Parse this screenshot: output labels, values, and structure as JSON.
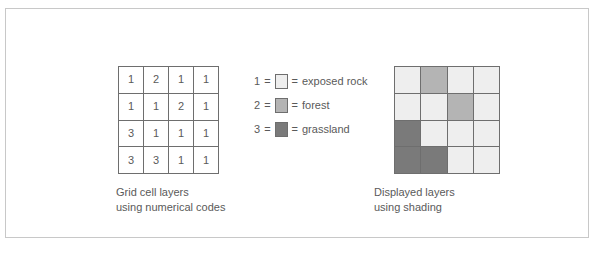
{
  "figure": {
    "border_color": "#c8c8c8",
    "background": "#ffffff"
  },
  "palette": {
    "exposed_rock": "#eeeeee",
    "forest": "#b4b4b4",
    "grassland": "#7a7a7a",
    "grid_line": "#6e6e6e",
    "text": "#5a5a5a"
  },
  "numeric_grid": {
    "caption_line1": "Grid cell layers",
    "caption_line2": "using numerical codes",
    "rows": [
      [
        "1",
        "2",
        "1",
        "1"
      ],
      [
        "1",
        "1",
        "2",
        "1"
      ],
      [
        "3",
        "1",
        "1",
        "1"
      ],
      [
        "3",
        "3",
        "1",
        "1"
      ]
    ]
  },
  "legend": {
    "entries": [
      {
        "code": "1",
        "eq_left": "=",
        "eq_right": "=",
        "label": "exposed rock",
        "color": "#eeeeee"
      },
      {
        "code": "2",
        "eq_left": "=",
        "eq_right": "=",
        "label": "forest",
        "color": "#b4b4b4"
      },
      {
        "code": "3",
        "eq_left": "=",
        "eq_right": "=",
        "label": "grassland",
        "color": "#7a7a7a"
      }
    ]
  },
  "shaded_grid": {
    "caption_line1": "Displayed layers",
    "caption_line2": "using shading",
    "rows": [
      [
        "#eeeeee",
        "#b4b4b4",
        "#eeeeee",
        "#eeeeee"
      ],
      [
        "#eeeeee",
        "#eeeeee",
        "#b4b4b4",
        "#eeeeee"
      ],
      [
        "#7a7a7a",
        "#eeeeee",
        "#eeeeee",
        "#eeeeee"
      ],
      [
        "#7a7a7a",
        "#7a7a7a",
        "#eeeeee",
        "#eeeeee"
      ]
    ]
  }
}
